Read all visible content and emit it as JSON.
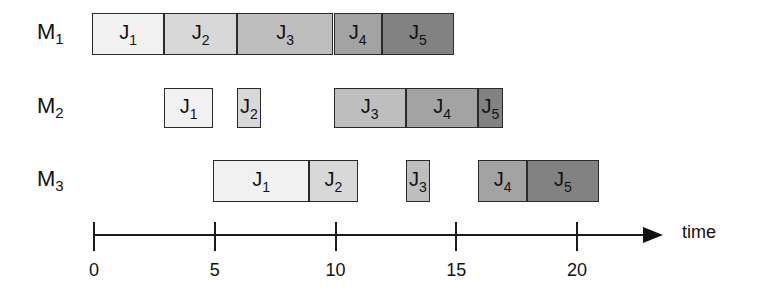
{
  "chart_data": {
    "type": "gantt",
    "title": "",
    "xlabel": "time",
    "ylabel": "",
    "xlim": [
      0,
      22
    ],
    "x_ticks": [
      0,
      5,
      10,
      15,
      20
    ],
    "grid": false,
    "machines": [
      "M1",
      "M2",
      "M3"
    ],
    "job_colors": {
      "J1": "#f1f1f1",
      "J2": "#d8d8d8",
      "J3": "#bebebe",
      "J4": "#a3a3a3",
      "J5": "#828282"
    },
    "schedule": [
      {
        "machine": "M1",
        "tasks": [
          {
            "job": "J1",
            "start": 0,
            "end": 3
          },
          {
            "job": "J2",
            "start": 3,
            "end": 6
          },
          {
            "job": "J3",
            "start": 6,
            "end": 10
          },
          {
            "job": "J4",
            "start": 10,
            "end": 12
          },
          {
            "job": "J5",
            "start": 12,
            "end": 15
          }
        ]
      },
      {
        "machine": "M2",
        "tasks": [
          {
            "job": "J1",
            "start": 3,
            "end": 5
          },
          {
            "job": "J2",
            "start": 6,
            "end": 7
          },
          {
            "job": "J3",
            "start": 10,
            "end": 13
          },
          {
            "job": "J4",
            "start": 13,
            "end": 16
          },
          {
            "job": "J5",
            "start": 16,
            "end": 17
          }
        ]
      },
      {
        "machine": "M3",
        "tasks": [
          {
            "job": "J1",
            "start": 5,
            "end": 9
          },
          {
            "job": "J2",
            "start": 9,
            "end": 11
          },
          {
            "job": "J3",
            "start": 13,
            "end": 14
          },
          {
            "job": "J4",
            "start": 16,
            "end": 18
          },
          {
            "job": "J5",
            "start": 18,
            "end": 21
          }
        ]
      }
    ]
  },
  "labels": {
    "machine_prefix": "M",
    "job_prefix": "J",
    "axis_title": "time"
  }
}
